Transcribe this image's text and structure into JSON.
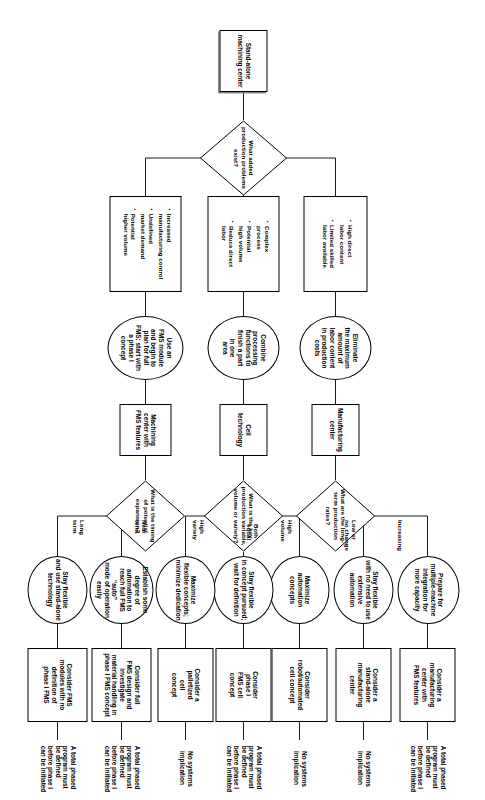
{
  "start": {
    "label": "Stand-alone machining center"
  },
  "decisions": [
    {
      "id": "d1",
      "label": "What added production problems exist?"
    },
    {
      "id": "d2",
      "label": "What are the long-term production rates?"
    },
    {
      "id": "d3",
      "label": "What is the key production variable, volume or variety?"
    },
    {
      "id": "d4",
      "label": "What is the timing of potential expansion?"
    }
  ],
  "branch_bullets": [
    {
      "id": "b1",
      "items": [
        "High direct\nlabor content",
        "Limited skilled\nlabor available"
      ]
    },
    {
      "id": "b2",
      "items": [
        "Complex\nprocess",
        "Potential\nhigh volume",
        "Reduce direct\nlabor"
      ]
    },
    {
      "id": "b3",
      "items": [
        "Increased\nmanufacturing control",
        "Undefined\nmarket demand",
        "Potential\nhigher volume"
      ]
    }
  ],
  "strategies": [
    {
      "id": "s1",
      "label": "Eliminate\nthe maximum\namount of\nlabor content\nin production\ncosts"
    },
    {
      "id": "s2",
      "label": "Combine\nprocessing\nfunctions to\nfinish a part\nin one\narea"
    },
    {
      "id": "s3",
      "label": "Use an\nFMS module\nand begin to\nplan for full\nFMS: start with\na phase I\nconcept"
    }
  ],
  "systems": [
    {
      "id": "y1",
      "label": "Manufacturing\ncenter"
    },
    {
      "id": "y2",
      "label": "Cell\ntechnology"
    },
    {
      "id": "y3",
      "label": "Machining\ncenter with\nFMS features"
    }
  ],
  "edge_labels": [
    {
      "id": "e1",
      "label": "Increasing"
    },
    {
      "id": "e2",
      "label": "Low or\nno change"
    },
    {
      "id": "e3",
      "label": "High\nvolume"
    },
    {
      "id": "e4",
      "label": "Both\nequal"
    },
    {
      "id": "e5",
      "label": "High\nvariety"
    },
    {
      "id": "e6",
      "label": "Near\nterm"
    },
    {
      "id": "e7",
      "label": "Long\nterm"
    }
  ],
  "approaches": [
    {
      "id": "a1",
      "label": "Prepare for\nmultiple-machine\nintegration for\nmore capacity"
    },
    {
      "id": "a2",
      "label": "Stay flexible\nwith no need to use\nextensive automation"
    },
    {
      "id": "a3",
      "label": "Maximize\nautomation\nconcepts"
    },
    {
      "id": "a4",
      "label": "Stay flexible\nin concept pursued;\nwait for definition"
    },
    {
      "id": "a5",
      "label": "Maximize\nflexible concepts;\nminimize dedication"
    },
    {
      "id": "a6",
      "label": "Establish some\ndegree of automation to\nreach full FMS “auto”\nmode of operation easily"
    },
    {
      "id": "a7",
      "label": "Stay flexible\nand use stand-alone\ntechnology"
    }
  ],
  "concepts": [
    {
      "id": "c1",
      "label": "Consider a\nmanufacturing\ncenter with\nFMS features"
    },
    {
      "id": "c2",
      "label": "Consider a\nstand-alone\nmanufacturing\ncenter"
    },
    {
      "id": "c3",
      "label": "Consider\nrobot/automated\ncell concept"
    },
    {
      "id": "c4",
      "label": "Consider\nphase I\nFMS cell\nconcept"
    },
    {
      "id": "c5",
      "label": "Consider a\npalletized\ncell\nconcept"
    },
    {
      "id": "c6",
      "label": "Consider full\nFMS design and\ninvestigate\nmaterial handling in\nphase I FMS concept"
    },
    {
      "id": "c7",
      "label": "Consider FMS\nmodules with no\ndefinition of\nphase I FMS"
    }
  ],
  "implications": [
    {
      "id": "i1",
      "label": "A total phased\nprogram must\nbe defined\nbefore phase I\ncan be initiated"
    },
    {
      "id": "i2",
      "label": "No systems\nimplication"
    },
    {
      "id": "i3",
      "label": "No systems\nimplication"
    },
    {
      "id": "i4",
      "label": "A total phased\nprogram must\nbe defined\nbefore phase I\ncan be initiated"
    },
    {
      "id": "i5",
      "label": "No systems\nimplication"
    },
    {
      "id": "i6",
      "label": "A total phased\nprogram must\nbe defined\nbefore phase I\ncan be initiated"
    },
    {
      "id": "i7",
      "label": "A total phased\nprogram must\nbe defined\nbefore phase I\ncan be initiated"
    }
  ]
}
